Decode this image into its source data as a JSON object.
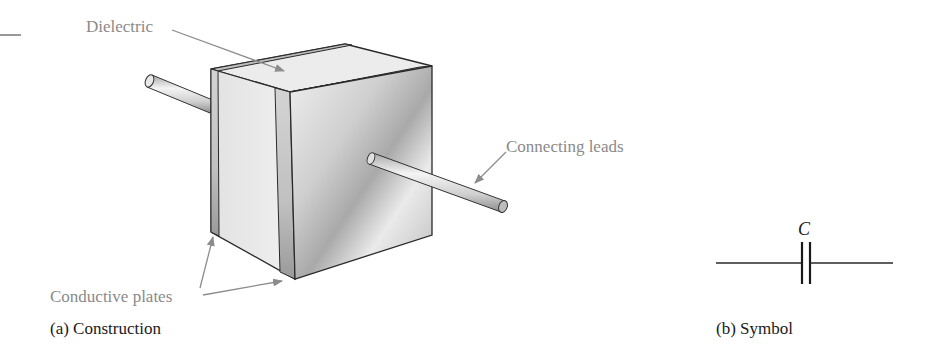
{
  "figure": {
    "type": "capacitor-diagram",
    "panels": [
      {
        "id": "a",
        "caption": "(a) Construction",
        "callouts": {
          "dielectric": "Dielectric",
          "connecting_leads": "Connecting leads",
          "conductive_plates": "Conductive plates"
        }
      },
      {
        "id": "b",
        "caption": "(b) Symbol",
        "symbol_label": "C"
      }
    ],
    "colors": {
      "callout_text": "#8a8a8a",
      "callout_arrow": "#8c8c8c",
      "caption_text": "#1a1a1a",
      "outline": "#2a2a2a",
      "plate": "#c8c8c8",
      "dielectric_face": "#e6e6e6",
      "front_face": "#d8d8d8"
    }
  }
}
